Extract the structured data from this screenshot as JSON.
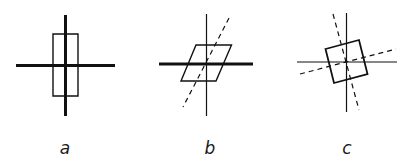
{
  "figure": {
    "colors": {
      "ink": "#111111",
      "background": "#ffffff"
    },
    "panels": [
      {
        "id": "a",
        "label": "a",
        "description": "Rectangle aligned with thick perpendicular axes",
        "axes": [
          {
            "type": "solid-thick",
            "x1": 65.5,
            "y1": 15,
            "x2": 65.5,
            "y2": 116
          },
          {
            "type": "solid-thick",
            "x1": 16,
            "y1": 65.5,
            "x2": 115,
            "y2": 65.5
          }
        ],
        "shape": {
          "type": "rectangle",
          "points": [
            [
              53,
              34
            ],
            [
              78,
              34
            ],
            [
              78,
              96
            ],
            [
              53,
              96
            ]
          ]
        }
      },
      {
        "id": "b",
        "label": "b",
        "description": "Sheared parallelogram with thick horizontal axis, thin vertical axis and dashed oblique axis",
        "axes": [
          {
            "type": "solid-thin",
            "x1": 206.5,
            "y1": 14,
            "x2": 206.5,
            "y2": 116
          },
          {
            "type": "solid-thick",
            "x1": 159,
            "y1": 64,
            "x2": 253,
            "y2": 64
          },
          {
            "type": "dashed",
            "x1": 229,
            "y1": 18,
            "x2": 183,
            "y2": 107
          }
        ],
        "shape": {
          "type": "parallelogram",
          "points": [
            [
              196,
              45
            ],
            [
              231.5,
              45
            ],
            [
              216,
              81
            ],
            [
              181,
              81
            ]
          ]
        }
      },
      {
        "id": "c",
        "label": "c",
        "description": "Rotated square with thin axes and two dashed rotated axes",
        "axes": [
          {
            "type": "solid-thin",
            "x1": 346.5,
            "y1": 13,
            "x2": 346.5,
            "y2": 112
          },
          {
            "type": "solid-thin",
            "x1": 297,
            "y1": 62,
            "x2": 397,
            "y2": 62
          },
          {
            "type": "dashed",
            "x1": 333,
            "y1": 14,
            "x2": 359,
            "y2": 110
          },
          {
            "type": "dashed",
            "x1": 300,
            "y1": 74,
            "x2": 396,
            "y2": 49
          }
        ],
        "shape": {
          "type": "square",
          "points": [
            [
              325.5,
              49
            ],
            [
              359,
              40
            ],
            [
              367.5,
              74
            ],
            [
              334,
              83
            ]
          ]
        }
      }
    ],
    "labels": [
      {
        "text": "a",
        "x": 65,
        "y": 154
      },
      {
        "text": "b",
        "x": 210,
        "y": 154
      },
      {
        "text": "c",
        "x": 347,
        "y": 154
      }
    ]
  }
}
